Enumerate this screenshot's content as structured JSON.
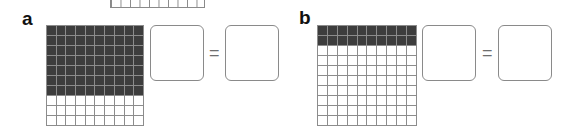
{
  "exercise": {
    "fragment_grid": {
      "columns": 10
    },
    "parts": [
      {
        "label": "a",
        "grid": {
          "rows": 10,
          "columns": 10,
          "shaded_rows": 7,
          "shaded_cells": 70,
          "total_cells": 100
        },
        "equation": {
          "left_box": "",
          "operator": "=",
          "right_box": ""
        }
      },
      {
        "label": "b",
        "grid": {
          "rows": 10,
          "columns": 10,
          "shaded_rows": 2,
          "shaded_cells": 20,
          "total_cells": 100
        },
        "equation": {
          "left_box": "",
          "operator": "=",
          "right_box": ""
        }
      }
    ],
    "colors": {
      "shaded": "#3d3d3d",
      "gridline": "#8c8c8c",
      "box_border": "#8a8a8a",
      "background": "#ffffff"
    }
  }
}
